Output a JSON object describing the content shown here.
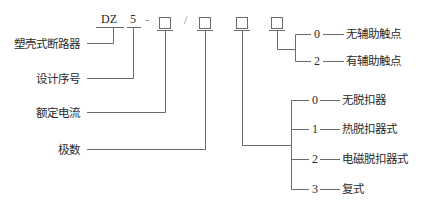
{
  "diagram": {
    "code": {
      "prefix": "DZ",
      "series": "5",
      "sep1": "-",
      "sep2": "/",
      "placeholder": "□"
    },
    "left_labels": [
      {
        "text": "塑壳式断路器"
      },
      {
        "text": "设计序号"
      },
      {
        "text": "额定电流"
      },
      {
        "text": "极数"
      }
    ],
    "aux_contact_options": [
      {
        "code": "0",
        "text": "无辅助触点"
      },
      {
        "code": "2",
        "text": "有辅助触点"
      }
    ],
    "release_options": [
      {
        "code": "0",
        "text": "无脱扣器"
      },
      {
        "code": "1",
        "text": "热脱扣器式"
      },
      {
        "code": "2",
        "text": "电磁脱扣器式"
      },
      {
        "code": "3",
        "text": "复式"
      }
    ],
    "colors": {
      "line": "#555555",
      "text": "#2a2a2a"
    }
  }
}
